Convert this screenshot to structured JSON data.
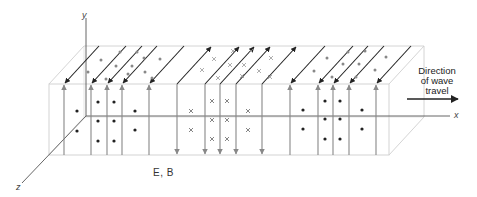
{
  "figure": {
    "labels": {
      "y_axis": "y",
      "x_axis": "x",
      "z_axis": "z",
      "fields": "E, B",
      "direction_line1": "Direction",
      "direction_line2": "of wave",
      "direction_line3": "travel"
    },
    "colors": {
      "box_edge": "#c8c8c8",
      "axis": "#555555",
      "e_field": "#888888",
      "b_field": "#222222",
      "dot_front": "#222222",
      "dot_top": "#888888",
      "cross": "#666666"
    },
    "geometry": {
      "front_left": 49,
      "front_right": 389,
      "front_top": 84,
      "front_bottom": 155,
      "depth_dx": 35,
      "depth_dy": -38,
      "origin": [
        86,
        116
      ]
    },
    "e_field_lines": [
      {
        "x": 64,
        "dir": "up"
      },
      {
        "x": 91,
        "dir": "up"
      },
      {
        "x": 107,
        "dir": "up"
      },
      {
        "x": 122,
        "dir": "up"
      },
      {
        "x": 149,
        "dir": "up"
      },
      {
        "x": 177,
        "dir": "down"
      },
      {
        "x": 205,
        "dir": "down"
      },
      {
        "x": 220,
        "dir": "down"
      },
      {
        "x": 236,
        "dir": "down"
      },
      {
        "x": 262,
        "dir": "down"
      },
      {
        "x": 290,
        "dir": "up"
      },
      {
        "x": 318,
        "dir": "up"
      },
      {
        "x": 333,
        "dir": "up"
      },
      {
        "x": 349,
        "dir": "up"
      },
      {
        "x": 376,
        "dir": "up"
      }
    ],
    "b_field_lines": [
      {
        "x": 64,
        "dir": "toward_viewer"
      },
      {
        "x": 91,
        "dir": "toward_viewer"
      },
      {
        "x": 107,
        "dir": "toward_viewer"
      },
      {
        "x": 122,
        "dir": "toward_viewer"
      },
      {
        "x": 149,
        "dir": "toward_viewer"
      },
      {
        "x": 177,
        "dir": "away"
      },
      {
        "x": 205,
        "dir": "away"
      },
      {
        "x": 220,
        "dir": "away"
      },
      {
        "x": 236,
        "dir": "away"
      },
      {
        "x": 262,
        "dir": "away"
      },
      {
        "x": 290,
        "dir": "toward_viewer"
      },
      {
        "x": 318,
        "dir": "toward_viewer"
      },
      {
        "x": 333,
        "dir": "toward_viewer"
      },
      {
        "x": 349,
        "dir": "toward_viewer"
      },
      {
        "x": 376,
        "dir": "toward_viewer"
      }
    ],
    "front_dots": [
      [
        77,
        111
      ],
      [
        77,
        131
      ],
      [
        98,
        102
      ],
      [
        114,
        102
      ],
      [
        98,
        121
      ],
      [
        114,
        121
      ],
      [
        98,
        141
      ],
      [
        114,
        141
      ],
      [
        135,
        111
      ],
      [
        135,
        130
      ],
      [
        303,
        110
      ],
      [
        303,
        129
      ],
      [
        325,
        101
      ],
      [
        340,
        101
      ],
      [
        325,
        119
      ],
      [
        340,
        119
      ],
      [
        325,
        139
      ],
      [
        340,
        139
      ],
      [
        362,
        110
      ],
      [
        362,
        129
      ]
    ],
    "front_crosses": [
      [
        191,
        111
      ],
      [
        191,
        130
      ],
      [
        212,
        101
      ],
      [
        227,
        101
      ],
      [
        212,
        120
      ],
      [
        227,
        120
      ],
      [
        212,
        139
      ],
      [
        227,
        139
      ],
      [
        248,
        111
      ],
      [
        248,
        130
      ]
    ],
    "top_dots": [
      [
        88,
        72
      ],
      [
        101,
        60
      ],
      [
        106,
        79
      ],
      [
        116,
        66
      ],
      [
        120,
        52
      ],
      [
        128,
        74
      ],
      [
        132,
        66
      ],
      [
        137,
        52
      ],
      [
        145,
        72
      ],
      [
        152,
        78
      ],
      [
        160,
        59
      ],
      [
        144,
        58
      ],
      [
        314,
        71
      ],
      [
        327,
        58
      ],
      [
        332,
        77
      ],
      [
        343,
        64
      ],
      [
        348,
        52
      ],
      [
        356,
        77
      ],
      [
        359,
        64
      ],
      [
        365,
        51
      ],
      [
        375,
        70
      ],
      [
        386,
        57
      ]
    ],
    "top_crosses": [
      [
        202,
        70
      ],
      [
        214,
        59
      ],
      [
        218,
        78
      ],
      [
        230,
        65
      ],
      [
        233,
        51
      ],
      [
        242,
        76
      ],
      [
        244,
        65
      ],
      [
        251,
        51
      ],
      [
        259,
        71
      ],
      [
        271,
        58
      ],
      [
        270,
        77
      ]
    ]
  }
}
